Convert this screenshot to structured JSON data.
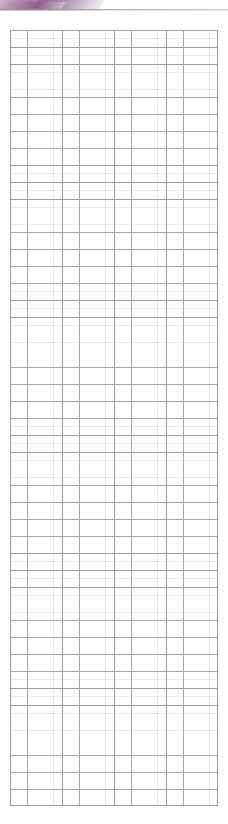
{
  "page": {
    "width": 228,
    "height": 824,
    "background_color": "#ffffff",
    "kind": "scanned-ruled-grid-page"
  },
  "header": {
    "title": "",
    "title_note": "decorative banner text clipped off the top edge of the scan; glyphs illegible",
    "swoosh_colors": [
      "#c9b6cb",
      "#a87fa3",
      "#93628e",
      "#ded4dd"
    ],
    "rule_color": "#8e8e94",
    "band_height": 11
  },
  "grid": {
    "columns": 12,
    "rows": 46,
    "line_color": "#8f8f96",
    "minor_line_color": "#b0b0b6",
    "cell_width": 17.33,
    "cell_height": 16.87,
    "left": 10,
    "top": 30,
    "width": 208,
    "height": 776,
    "minor_divisions_per_cell": 2,
    "cells": []
  }
}
